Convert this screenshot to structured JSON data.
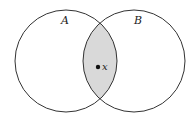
{
  "diagram": {
    "type": "venn",
    "sets": [
      {
        "label": "A",
        "cx": 66,
        "cy": 61,
        "r": 51
      },
      {
        "label": "B",
        "cx": 134,
        "cy": 61,
        "r": 51
      }
    ],
    "intersection": {
      "shaded": true,
      "fill": "#d9d9d9"
    },
    "point": {
      "label": "x",
      "cx": 98,
      "cy": 67
    },
    "stroke_color": "#333333"
  }
}
